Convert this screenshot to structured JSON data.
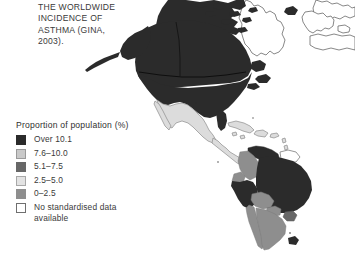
{
  "caption": {
    "text": "THE WORLDWIDE\nINCIDENCE OF\nASTHMA (GINA,\n2003)."
  },
  "legend": {
    "title": "Proportion of population (%)",
    "items": [
      {
        "label": "Over 10.1",
        "color": "#2b2b2b",
        "border": "#2b2b2b"
      },
      {
        "label": "7.6–10.0",
        "color": "#c9c9c9",
        "border": "#9a9a9a"
      },
      {
        "label": "5.1–7.5",
        "color": "#676767",
        "border": "#676767"
      },
      {
        "label": "2.5–5.0",
        "color": "#e3e3e3",
        "border": "#a8a8a8"
      },
      {
        "label": "0–2.5",
        "color": "#8e8e8e",
        "border": "#8e8e8e"
      },
      {
        "label": "No standardised data\navailable",
        "color": "#ffffff",
        "border": "#6f6f6f"
      }
    ]
  },
  "map": {
    "title": "Worldwide incidence of asthma",
    "projection": "world-americas-view",
    "ocean_color": "#ffffff",
    "outline_color": "#4a4a4a",
    "regions": [
      {
        "name": "Canada",
        "class": "Over 10.1",
        "fill": "#2b2b2b"
      },
      {
        "name": "United States",
        "class": "Over 10.1",
        "fill": "#2b2b2b"
      },
      {
        "name": "Alaska",
        "class": "Over 10.1",
        "fill": "#2b2b2b"
      },
      {
        "name": "Greenland",
        "class": "No standardised data available",
        "fill": "#ffffff"
      },
      {
        "name": "Iceland",
        "class": "Over 10.1",
        "fill": "#2b2b2b"
      },
      {
        "name": "Mexico",
        "class": "2.5–5.0",
        "fill": "#dcdcdc"
      },
      {
        "name": "Central America",
        "class": "2.5–5.0",
        "fill": "#dcdcdc"
      },
      {
        "name": "Cuba",
        "class": "2.5–5.0",
        "fill": "#dcdcdc"
      },
      {
        "name": "Caribbean islands",
        "class": "2.5–5.0",
        "fill": "#dcdcdc"
      },
      {
        "name": "Colombia",
        "class": "0–2.5",
        "fill": "#8e8e8e"
      },
      {
        "name": "Venezuela",
        "class": "Over 10.1",
        "fill": "#2b2b2b"
      },
      {
        "name": "Guianas",
        "class": "No standardised data available",
        "fill": "#ffffff"
      },
      {
        "name": "Ecuador",
        "class": "0–2.5",
        "fill": "#8e8e8e"
      },
      {
        "name": "Peru",
        "class": "Over 10.1",
        "fill": "#2b2b2b"
      },
      {
        "name": "Brazil",
        "class": "Over 10.1",
        "fill": "#2b2b2b"
      },
      {
        "name": "Bolivia",
        "class": "0–2.5",
        "fill": "#8e8e8e"
      },
      {
        "name": "Paraguay",
        "class": "0–2.5",
        "fill": "#8e8e8e"
      },
      {
        "name": "Chile",
        "class": "0–2.5",
        "fill": "#8e8e8e"
      },
      {
        "name": "Argentina",
        "class": "0–2.5",
        "fill": "#8e8e8e"
      },
      {
        "name": "Uruguay",
        "class": "5.1–7.5",
        "fill": "#676767"
      },
      {
        "name": "Falkland Islands",
        "class": "Over 10.1",
        "fill": "#2b2b2b"
      },
      {
        "name": "Western Europe",
        "class": "No standardised data available",
        "fill": "#ffffff"
      },
      {
        "name": "North Africa",
        "class": "No standardised data available",
        "fill": "#ffffff"
      }
    ]
  }
}
